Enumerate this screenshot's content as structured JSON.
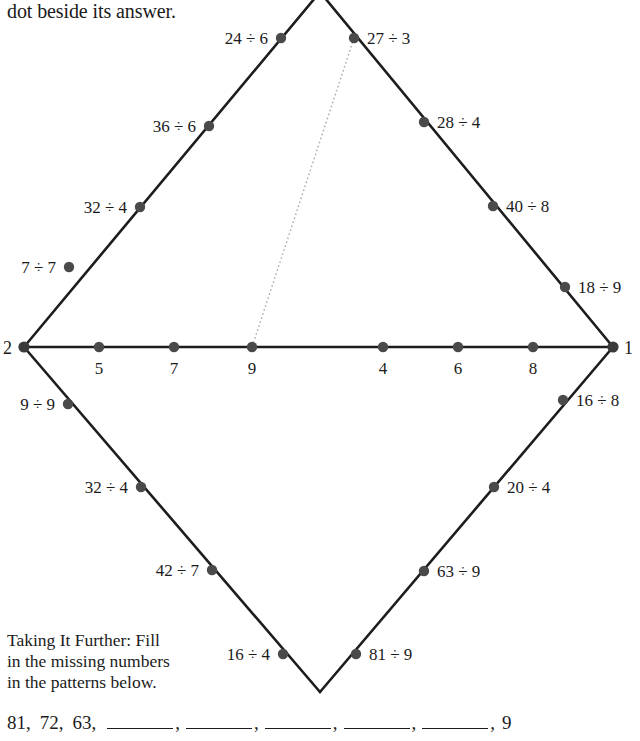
{
  "instruction": "dot beside its answer.",
  "diagram": {
    "vertices": [
      {
        "name": "left-vertex",
        "label": "2",
        "x": 24,
        "y": 347,
        "label_x": 3,
        "label_y": 354
      },
      {
        "name": "right-vertex",
        "label": "1",
        "x": 613,
        "y": 347,
        "label_x": 624,
        "label_y": 354
      },
      {
        "name": "top-vertex",
        "label": "",
        "x": 320,
        "y": -8,
        "label_x": 0,
        "label_y": 0
      },
      {
        "name": "bottom-vertex",
        "label": "",
        "x": 320,
        "y": 692,
        "label_x": 0,
        "label_y": 0
      }
    ],
    "axis_nodes": [
      {
        "label": "5",
        "x": 99,
        "y": 347,
        "label_x": 99,
        "label_y": 374
      },
      {
        "label": "7",
        "x": 174,
        "y": 347,
        "label_x": 174,
        "label_y": 374
      },
      {
        "label": "9",
        "x": 252,
        "y": 347,
        "label_x": 252,
        "label_y": 374
      },
      {
        "label": "4",
        "x": 383,
        "y": 347,
        "label_x": 383,
        "label_y": 374
      },
      {
        "label": "6",
        "x": 458,
        "y": 347,
        "label_x": 458,
        "label_y": 374
      },
      {
        "label": "8",
        "x": 533,
        "y": 347,
        "label_x": 533,
        "label_y": 374
      }
    ],
    "edge_nodes": [
      {
        "label": "24 ÷ 6",
        "x": 281,
        "y": 38,
        "label_x": 268,
        "label_y": 44,
        "anchor": "end"
      },
      {
        "label": "27 ÷ 3",
        "x": 354,
        "y": 38,
        "label_x": 367,
        "label_y": 44,
        "anchor": "start"
      },
      {
        "label": "36 ÷ 6",
        "x": 209,
        "y": 126,
        "label_x": 196,
        "label_y": 132,
        "anchor": "end"
      },
      {
        "label": "28 ÷ 4",
        "x": 424,
        "y": 122,
        "label_x": 437,
        "label_y": 128,
        "anchor": "start"
      },
      {
        "label": "32 ÷ 4",
        "x": 140,
        "y": 207,
        "label_x": 127,
        "label_y": 213,
        "anchor": "end"
      },
      {
        "label": "40 ÷ 8",
        "x": 493,
        "y": 206,
        "label_x": 506,
        "label_y": 212,
        "anchor": "start"
      },
      {
        "label": "7 ÷ 7",
        "x": 69,
        "y": 267,
        "label_x": 56,
        "label_y": 273,
        "anchor": "end"
      },
      {
        "label": "18 ÷ 9",
        "x": 565,
        "y": 287,
        "label_x": 578,
        "label_y": 293,
        "anchor": "start"
      },
      {
        "label": "9 ÷ 9",
        "x": 68,
        "y": 404,
        "label_x": 55,
        "label_y": 410,
        "anchor": "end"
      },
      {
        "label": "16 ÷ 8",
        "x": 563,
        "y": 400,
        "label_x": 576,
        "label_y": 406,
        "anchor": "start"
      },
      {
        "label": "32 ÷ 4",
        "x": 141,
        "y": 487,
        "label_x": 128,
        "label_y": 493,
        "anchor": "end"
      },
      {
        "label": "20 ÷ 4",
        "x": 494,
        "y": 487,
        "label_x": 507,
        "label_y": 493,
        "anchor": "start"
      },
      {
        "label": "42 ÷ 7",
        "x": 212,
        "y": 570,
        "label_x": 199,
        "label_y": 576,
        "anchor": "end"
      },
      {
        "label": "63 ÷ 9",
        "x": 424,
        "y": 571,
        "label_x": 437,
        "label_y": 577,
        "anchor": "start"
      },
      {
        "label": "16 ÷ 4",
        "x": 283,
        "y": 654,
        "label_x": 270,
        "label_y": 660,
        "anchor": "end"
      },
      {
        "label": "81 ÷ 9",
        "x": 356,
        "y": 654,
        "label_x": 369,
        "label_y": 660,
        "anchor": "start"
      }
    ],
    "hint_line": {
      "from_x": 354,
      "from_y": 38,
      "to_x": 252,
      "to_y": 347
    }
  },
  "further": {
    "line1": "Taking It Further: Fill",
    "line2": "in the missing numbers",
    "line3": "in the patterns below."
  },
  "pattern": {
    "given_start": [
      "81,",
      "72,",
      "63,"
    ],
    "blank_count": 5,
    "given_end": "9",
    "comma": ","
  }
}
